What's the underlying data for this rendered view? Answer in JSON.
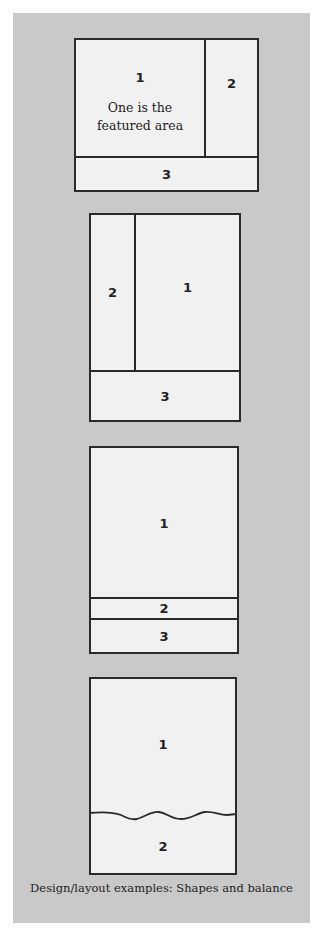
{
  "colors": {
    "panel_background": "#c9c9c9",
    "box_fill": "#f1f1f1",
    "line": "#2a2a2a"
  },
  "figures": [
    {
      "name": "layout-a",
      "regions": [
        {
          "label": "1",
          "note": "One is the featured area"
        },
        {
          "label": "2"
        },
        {
          "label": "3"
        }
      ]
    },
    {
      "name": "layout-b",
      "regions": [
        {
          "label": "2"
        },
        {
          "label": "1"
        },
        {
          "label": "3"
        }
      ]
    },
    {
      "name": "layout-c",
      "regions": [
        {
          "label": "1"
        },
        {
          "label": "2"
        },
        {
          "label": "3"
        }
      ]
    },
    {
      "name": "layout-d",
      "regions": [
        {
          "label": "1"
        },
        {
          "label": "2"
        }
      ],
      "divider": "wavy"
    }
  ],
  "caption": "Design/layout examples: Shapes and balance"
}
